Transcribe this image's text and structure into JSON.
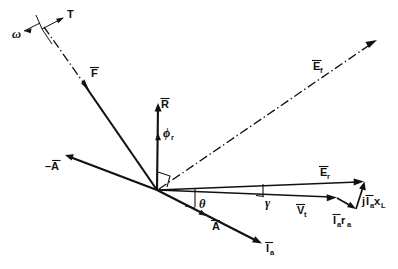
{
  "figure": {
    "type": "vector-phasor-diagram",
    "background_color": "#ffffff",
    "ink_color": "#111111",
    "width": 398,
    "height": 269
  },
  "labels": {
    "omega": "ω",
    "torque": "T",
    "force": "F",
    "reaction": "R",
    "phi_r": "ϕ",
    "phi_r_sub": "r",
    "emf_f": "E",
    "emf_f_sub": "f",
    "emf_r": "E",
    "emf_r_sub": "r",
    "neg_A": "–A",
    "A": "A",
    "I_a": "I",
    "I_a_sub": "a",
    "V_t": "V",
    "V_t_sub": "t",
    "Ia_ra": "I",
    "Ia_ra_sub1": "a",
    "Ia_ra_r": "r",
    "Ia_ra_sub2": "a",
    "jIa_xL_j": "j",
    "jIa_xL_I": "I",
    "jIa_xL_sub1": "a",
    "jIa_xL_x": "x",
    "jIa_xL_sub2": "L",
    "theta": "θ",
    "gamma": "γ"
  },
  "vectors": [
    {
      "name": "omega-arrow",
      "label": "ω",
      "origin": [
        36,
        22
      ],
      "tip": [
        20,
        33
      ],
      "style": "thin"
    },
    {
      "name": "torque-arrow",
      "label": "T",
      "origin": [
        42,
        28
      ],
      "tip": [
        64,
        18
      ],
      "style": "thin"
    },
    {
      "name": "force-vector",
      "label": "F",
      "origin": [
        44,
        26
      ],
      "tip": [
        157,
        190
      ],
      "style": "thick"
    },
    {
      "name": "reaction-vector",
      "label": "R",
      "origin": [
        157,
        190
      ],
      "tip": [
        158,
        103
      ],
      "style": "thick"
    },
    {
      "name": "emf-f-vector",
      "label": "E_f",
      "origin": [
        157,
        190
      ],
      "tip": [
        378,
        40
      ],
      "style": "dashdot"
    },
    {
      "name": "neg-A-vector",
      "label": "–A",
      "origin": [
        157,
        190
      ],
      "tip": [
        65,
        155
      ],
      "style": "thick"
    },
    {
      "name": "A-vector",
      "label": "A",
      "origin": [
        157,
        190
      ],
      "tip": [
        262,
        243
      ],
      "style": "thick"
    },
    {
      "name": "Ia-vector",
      "label": "I_a",
      "origin": [
        157,
        190
      ],
      "tip": [
        262,
        243
      ],
      "style": "thick"
    },
    {
      "name": "emf-r-vector",
      "label": "E_r",
      "origin": [
        157,
        190
      ],
      "tip": [
        363,
        182
      ],
      "style": "med"
    },
    {
      "name": "Vt-vector",
      "label": "V_t",
      "origin": [
        157,
        190
      ],
      "tip": [
        337,
        198
      ],
      "style": "med"
    },
    {
      "name": "Ia-ra-vector",
      "label": "I_a r_a",
      "origin": [
        337,
        198
      ],
      "tip": [
        355,
        208
      ],
      "style": "med"
    },
    {
      "name": "jIa-xL-vector",
      "label": "jI_a x_L",
      "origin": [
        355,
        208
      ],
      "tip": [
        364,
        181
      ],
      "style": "med"
    }
  ],
  "angles": [
    {
      "name": "theta-angle",
      "label": "θ",
      "vertex": [
        157,
        190
      ],
      "between": [
        "E_r axis",
        "I_a"
      ]
    },
    {
      "name": "gamma-angle",
      "label": "γ",
      "vertex": [
        157,
        190
      ],
      "between": [
        "E_r",
        "V_t"
      ]
    },
    {
      "name": "phi-r-angle",
      "label": "ϕ_r",
      "vertex": [
        157,
        190
      ],
      "between": [
        "R",
        "E_r axis"
      ]
    },
    {
      "name": "right-angle-mark",
      "label": "",
      "vertex": [
        157,
        190
      ],
      "between": [
        "R",
        "E_f"
      ]
    }
  ],
  "notes": {
    "caption": ""
  }
}
